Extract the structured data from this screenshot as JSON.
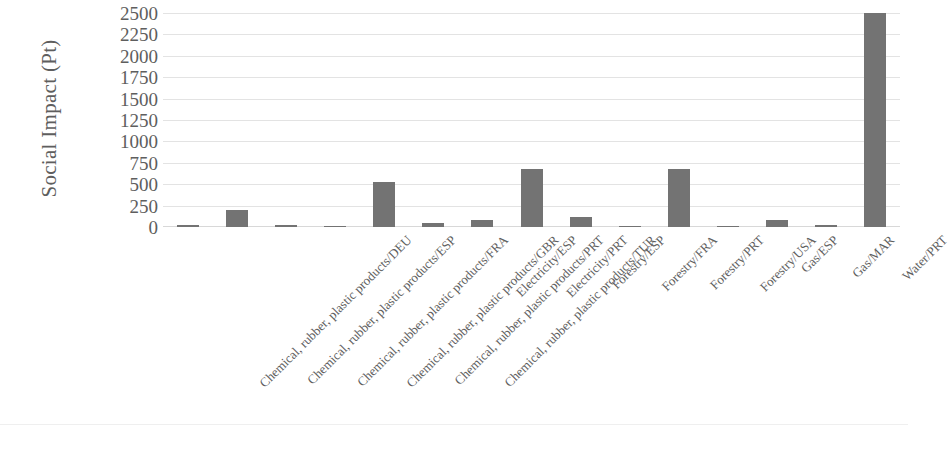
{
  "chart_data": {
    "type": "bar",
    "title": "",
    "xlabel": "",
    "ylabel": "Social Impact (Pt)",
    "ylim": [
      0,
      2500
    ],
    "y_ticks": [
      2500,
      2250,
      2000,
      1750,
      1500,
      1250,
      1000,
      750,
      500,
      250,
      0
    ],
    "y_tick_labels": [
      "2500",
      "2250",
      "2000",
      "1750",
      "1500",
      "1250",
      "1000",
      "750",
      "500",
      "250",
      "0"
    ],
    "grid": true,
    "legend": "none",
    "bar_color": "#737373",
    "gridline_color": "#e3e3e3",
    "text_color": "#5e5e5e",
    "categories": [
      "Chemical, rubber, plastic products/DEU",
      "Chemical, rubber, plastic products/ESP",
      "Chemical, rubber, plastic products/FRA",
      "Chemical, rubber, plastic products/GBR",
      "Chemical, rubber, plastic products/PRT",
      "Chemical, rubber, plastic products/TUR",
      "Electricity/ESP",
      "Electricity/PRT",
      "Forestry/ESP",
      "Forestry/FRA",
      "Forestry/PRT",
      "Forestry/USA",
      "Gas/ESP",
      "Gas/MAR",
      "Water/PRT"
    ],
    "values": [
      20,
      200,
      18,
      15,
      530,
      45,
      85,
      680,
      120,
      5,
      680,
      4,
      80,
      18,
      2500
    ]
  }
}
